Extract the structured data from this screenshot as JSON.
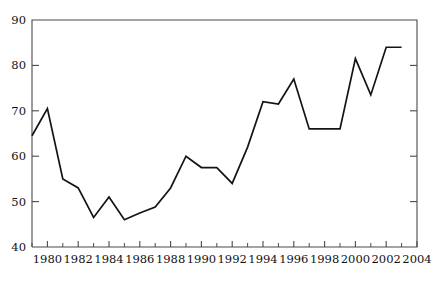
{
  "chart_data": {
    "type": "line",
    "title": "",
    "subtitle": "",
    "xlabel": "",
    "ylabel": "",
    "grid": false,
    "legend": null,
    "xlim": [
      1979,
      2004
    ],
    "ylim": [
      40,
      90
    ],
    "y_ticks": [
      40,
      50,
      60,
      70,
      80,
      90
    ],
    "y_tick_labels": [
      "40",
      "50",
      "60",
      "70",
      "80",
      "90"
    ],
    "x_ticks": [
      1980,
      1982,
      1984,
      1986,
      1988,
      1990,
      1992,
      1994,
      1996,
      1998,
      2000,
      2002,
      2004
    ],
    "x_tick_labels": [
      "1980",
      "1982",
      "1984",
      "1986",
      "1988",
      "1990",
      "1992",
      "1994",
      "1996",
      "1998",
      "2000",
      "2002",
      "2004"
    ],
    "x_minor_ticks": [
      1979,
      1981,
      1983,
      1985,
      1987,
      1989,
      1991,
      1993,
      1995,
      1997,
      1999,
      2001,
      2003
    ],
    "line_color": "#141414",
    "axis_color": "#4a4a4a",
    "series": [
      {
        "name": "series-1",
        "x": [
          1979,
          1980,
          1981,
          1982,
          1983,
          1984,
          1985,
          1986,
          1987,
          1988,
          1989,
          1990,
          1991,
          1992,
          1993,
          1994,
          1995,
          1996,
          1997,
          1998,
          1999,
          2000,
          2001,
          2002,
          2003
        ],
        "values": [
          64.5,
          70.5,
          55,
          53,
          46.5,
          51,
          46,
          47.5,
          48.8,
          53,
          60,
          57.5,
          57.5,
          54,
          62,
          72,
          71.5,
          77,
          66,
          66,
          66,
          81.5,
          73.5,
          84,
          84
        ]
      }
    ]
  },
  "axes": {
    "plot_left_px": 32,
    "plot_right_px": 417,
    "plot_top_px": 20,
    "plot_bottom_px": 247
  }
}
